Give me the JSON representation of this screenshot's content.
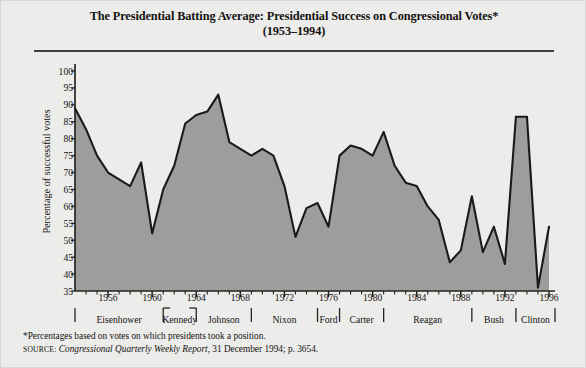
{
  "title": {
    "line1": "The Presidential Batting Average: Presidential Success on Congressional Votes*",
    "line2": "(1953–1994)"
  },
  "notes": {
    "footnote": "*Percentages based on votes on which presidents took a position.",
    "source_label": "SOURCE:",
    "source_italic": "Congressional Quarterly Weekly Report,",
    "source_rest": " 31 December 1994; p. 3654."
  },
  "colors": {
    "page_background": "#ececeb",
    "area_fill": "#9d9d9b",
    "line": "#1a1a18",
    "axis": "#26241f",
    "text": "#14120f",
    "rule": "#403e3c"
  },
  "chart_data": {
    "type": "area",
    "title": "The Presidential Batting Average: Presidential Success on Congressional Votes*",
    "subtitle": "(1953–1994)",
    "xlabel": "",
    "ylabel": "Percentage of successful votes",
    "ylim": [
      35,
      100
    ],
    "xlim": [
      1953,
      1996
    ],
    "grid": false,
    "legend": null,
    "yticks": [
      35,
      40,
      45,
      50,
      55,
      60,
      65,
      70,
      75,
      80,
      85,
      90,
      95,
      100
    ],
    "xticks": [
      1956,
      1960,
      1964,
      1968,
      1972,
      1976,
      1980,
      1984,
      1988,
      1992,
      1996
    ],
    "x": [
      1953,
      1954,
      1955,
      1956,
      1957,
      1958,
      1959,
      1960,
      1961,
      1962,
      1963,
      1964,
      1965,
      1966,
      1967,
      1968,
      1969,
      1970,
      1971,
      1972,
      1973,
      1974,
      1975,
      1976,
      1977,
      1978,
      1979,
      1980,
      1981,
      1982,
      1983,
      1984,
      1985,
      1986,
      1987,
      1988,
      1989,
      1990,
      1991,
      1992,
      1993,
      1994,
      1995,
      1996
    ],
    "values": [
      89.0,
      82.8,
      75.0,
      70.0,
      68.0,
      66.0,
      73.0,
      52.0,
      65.0,
      72.0,
      84.5,
      87.0,
      88.0,
      93.0,
      79.0,
      77.0,
      75.0,
      77.0,
      75.0,
      66.0,
      51.0,
      59.5,
      61.0,
      54.0,
      75.0,
      78.0,
      77.0,
      75.0,
      82.0,
      72.0,
      67.0,
      66.0,
      60.0,
      56.0,
      43.5,
      47.0,
      63.0,
      46.5,
      54.0,
      43.0,
      86.5,
      86.5,
      36.0,
      54.0
    ],
    "president_terms": [
      {
        "name": "Eisenhower",
        "start": 1953,
        "end": 1961
      },
      {
        "name": "Kennedy",
        "start": 1961,
        "end": 1964
      },
      {
        "name": "Johnson",
        "start": 1964,
        "end": 1969
      },
      {
        "name": "Nixon",
        "start": 1969,
        "end": 1975
      },
      {
        "name": "Ford",
        "start": 1975,
        "end": 1977
      },
      {
        "name": "Carter",
        "start": 1977,
        "end": 1981
      },
      {
        "name": "Reagan",
        "start": 1981,
        "end": 1989
      },
      {
        "name": "Bush",
        "start": 1989,
        "end": 1993
      },
      {
        "name": "Clinton",
        "start": 1993,
        "end": 1997
      }
    ]
  }
}
